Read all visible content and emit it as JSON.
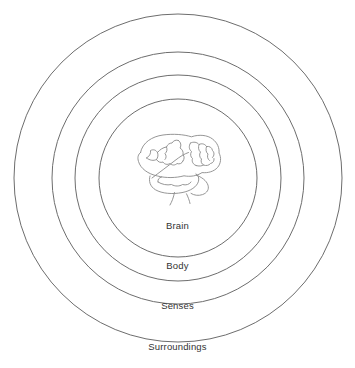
{
  "diagram": {
    "type": "concentric-circles",
    "title": "",
    "background_color": "#ffffff",
    "stroke_color": "#6d6d6d",
    "text_color": "#333333",
    "center": {
      "x": 178,
      "y": 178
    },
    "rings": [
      {
        "id": "brain",
        "label": "Brain",
        "radius": 79,
        "label_y": 226,
        "order": 1
      },
      {
        "id": "body",
        "label": "Body",
        "radius": 103,
        "label_y": 266,
        "order": 2
      },
      {
        "id": "senses",
        "label": "Senses",
        "radius": 126,
        "label_y": 306,
        "order": 3
      },
      {
        "id": "surroundings",
        "label": "Surroundings",
        "radius": 164,
        "label_y": 347,
        "order": 4
      }
    ],
    "center_illustration": {
      "name": "brain-illustration",
      "kind": "line-drawing",
      "stroke_color": "#8a8a8a",
      "center": {
        "x": 175,
        "y": 167
      }
    }
  }
}
